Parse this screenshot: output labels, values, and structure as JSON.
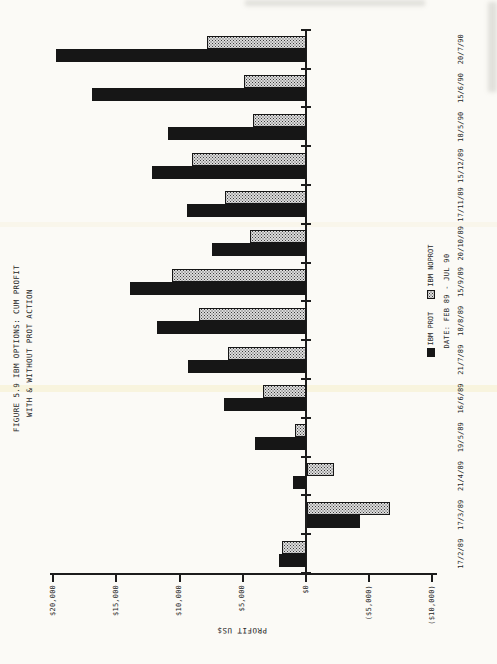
{
  "page": {
    "title_line1": "FIGURE 5.9 IBM OPTIONS: CUM PROFIT",
    "title_line2": "WITH & WITHOUT PROT ACTION"
  },
  "chart_data": {
    "type": "bar",
    "title": "FIGURE 5.9 IBM OPTIONS: CUM PROFIT WITH & WITHOUT PROT ACTION",
    "rotation_on_page_deg": -90,
    "categories": [
      "17/2/89",
      "17/3/89",
      "21/4/89",
      "19/5/89",
      "16/6/89",
      "21/7/89",
      "18/8/89",
      "15/9/89",
      "20/10/89",
      "17/11/89",
      "15/12/89",
      "18/5/90",
      "15/6/90",
      "20/7/90"
    ],
    "series": [
      {
        "name": "IBM PROT",
        "style": "solid-black",
        "values": [
          2100,
          -4200,
          1000,
          4000,
          6500,
          9300,
          11800,
          13900,
          7400,
          9400,
          12200,
          10900,
          16900,
          19800
        ]
      },
      {
        "name": "IBM NOPROT",
        "style": "dot-hatched",
        "values": [
          1900,
          -6600,
          -2100,
          900,
          3400,
          6200,
          8500,
          10600,
          4400,
          6400,
          9000,
          4200,
          4900,
          7800
        ]
      }
    ],
    "xlabel": "DATE: FEB 89 - JUL 90",
    "ylabel": "PROFIT US$",
    "ylim": [
      -10000,
      20000
    ],
    "ytick_step": 5000,
    "ytick_labels": [
      "$20,000",
      "$15,000",
      "$10,000",
      "$5,000",
      "$0",
      "($5,000)",
      "($10,000)"
    ],
    "grid": false,
    "legend_position": "below-plot",
    "colors": {
      "bar_prot": "#161616",
      "bar_noprot_fill": "#dcdcdc",
      "bar_noprot_dot": "#3c3c3c",
      "axis": "#1c1c1c",
      "paper": "#fbfaf6"
    }
  }
}
